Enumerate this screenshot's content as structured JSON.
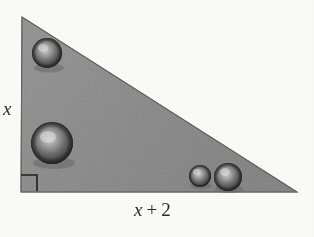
{
  "figure": {
    "type": "geometry-diagram",
    "shape": "right-triangle",
    "background_color": "#fdfdfc",
    "fill_color": "#8d8d8d",
    "fill_color_dark_edge": "#6f6f6f",
    "outline_color": "#6a6a6a",
    "ink_color": "#2b2b2b",
    "sphere_color": "#3a3a3a",
    "sphere_highlight_color": "#c8c8c8",
    "triangle": {
      "apex": {
        "x": 22,
        "y": 17
      },
      "bottom_left": {
        "x": 21,
        "y": 192
      },
      "bottom_right": {
        "x": 297,
        "y": 192
      }
    },
    "labels": {
      "leg_vertical": "x",
      "leg_horizontal_var": "x",
      "leg_horizontal_op": "+",
      "leg_horizontal_num": "2",
      "leg_horizontal_full": "x + 2"
    },
    "right_angle_marker": {
      "corner": "bottom-left",
      "size": 16,
      "x": 21,
      "y": 175
    },
    "spheres": [
      {
        "id": "sphere-upper-left",
        "cx": 47,
        "cy": 53,
        "r": 15
      },
      {
        "id": "sphere-lower-left",
        "cx": 52,
        "cy": 143,
        "r": 21
      },
      {
        "id": "sphere-bottom-mid",
        "cx": 200,
        "cy": 176,
        "r": 11
      },
      {
        "id": "sphere-bottom-right",
        "cx": 228,
        "cy": 177,
        "r": 14
      }
    ],
    "sphere_count": 4
  }
}
